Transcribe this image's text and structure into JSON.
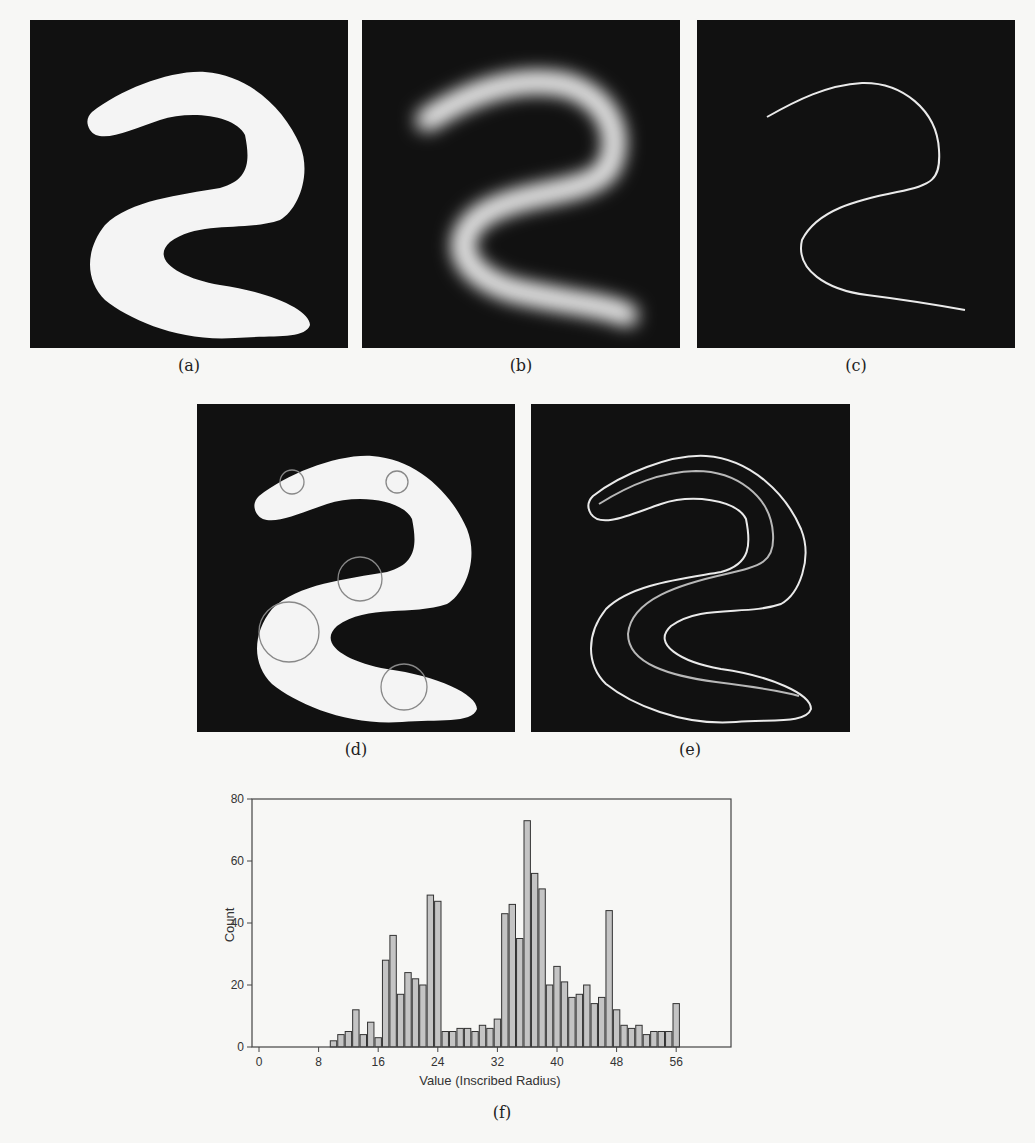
{
  "figure": {
    "panels": [
      {
        "id": "a",
        "label": "(a)",
        "description": "binary shape"
      },
      {
        "id": "b",
        "label": "(b)",
        "description": "distance map (blurred)"
      },
      {
        "id": "c",
        "label": "(c)",
        "description": "skeleton line"
      },
      {
        "id": "d",
        "label": "(d)",
        "description": "shape with inscribed circles"
      },
      {
        "id": "e",
        "label": "(e)",
        "description": "outline with medial line"
      },
      {
        "id": "f",
        "label": "(f)",
        "description": "histogram"
      }
    ]
  },
  "chart_data": {
    "type": "bar",
    "title": "",
    "xlabel": "Value (Inscribed Radius)",
    "ylabel": "Count",
    "xlim": [
      -1,
      63
    ],
    "ylim": [
      0,
      80
    ],
    "xticks": [
      0,
      8,
      16,
      24,
      32,
      40,
      48,
      56
    ],
    "yticks": [
      0,
      20,
      40,
      60,
      80
    ],
    "grid": false,
    "legend": null,
    "categories": [
      10,
      11,
      12,
      13,
      14,
      15,
      16,
      17,
      18,
      19,
      20,
      21,
      22,
      23,
      24,
      25,
      26,
      27,
      28,
      29,
      30,
      31,
      32,
      33,
      34,
      35,
      36,
      37,
      38,
      39,
      40,
      41,
      42,
      43,
      44,
      45,
      46,
      47,
      48,
      49,
      50,
      51,
      52,
      53,
      54,
      55,
      56
    ],
    "values": [
      2,
      4,
      5,
      12,
      4,
      8,
      3,
      28,
      36,
      17,
      24,
      22,
      20,
      49,
      47,
      5,
      5,
      6,
      6,
      5,
      7,
      6,
      9,
      43,
      46,
      35,
      73,
      56,
      51,
      20,
      26,
      21,
      16,
      17,
      20,
      14,
      16,
      44,
      12,
      7,
      6,
      7,
      4,
      5,
      5,
      5,
      14
    ],
    "bar_color": "#c4c4c4",
    "bar_edge": "#333333"
  }
}
